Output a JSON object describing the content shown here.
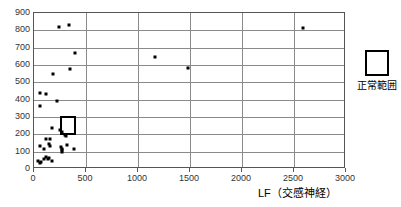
{
  "chart_data": {
    "type": "scatter",
    "title": "",
    "xlabel": "LF（交感神経）",
    "ylabel": "",
    "xlim": [
      0,
      3000
    ],
    "ylim": [
      0,
      900
    ],
    "xticks": [
      0,
      500,
      1000,
      1500,
      2000,
      2500,
      3000
    ],
    "xtick_labels": [
      "0",
      "500",
      "1000",
      "1500",
      "2000",
      "2500",
      "3000"
    ],
    "yticks": [
      0,
      100,
      200,
      300,
      400,
      500,
      600,
      700,
      800,
      900
    ],
    "ytick_labels": [
      "0",
      "100",
      "200",
      "300",
      "400",
      "500",
      "600",
      "700",
      "800",
      "900"
    ],
    "grid": true,
    "grid_axes": "both",
    "marker": "square",
    "marker_color": "#000000",
    "legend_position": "right-outside",
    "series": [
      {
        "name": "data",
        "points": [
          [
            245,
            818
          ],
          [
            335,
            832
          ],
          [
            2590,
            812
          ],
          [
            390,
            667
          ],
          [
            1160,
            645
          ],
          [
            1480,
            585
          ],
          [
            345,
            577
          ],
          [
            185,
            548
          ],
          [
            60,
            440
          ],
          [
            118,
            435
          ],
          [
            222,
            393
          ],
          [
            62,
            362
          ],
          [
            170,
            237
          ],
          [
            248,
            225
          ],
          [
            272,
            213
          ],
          [
            300,
            198
          ],
          [
            305,
            192
          ],
          [
            120,
            175
          ],
          [
            152,
            172
          ],
          [
            60,
            130
          ],
          [
            145,
            145
          ],
          [
            150,
            132
          ],
          [
            262,
            128
          ],
          [
            268,
            115
          ],
          [
            265,
            108
          ],
          [
            268,
            100
          ],
          [
            320,
            140
          ],
          [
            380,
            115
          ],
          [
            100,
            115
          ],
          [
            38,
            48
          ],
          [
            55,
            35
          ],
          [
            70,
            40
          ],
          [
            92,
            60
          ],
          [
            112,
            72
          ],
          [
            130,
            55
          ],
          [
            148,
            62
          ],
          [
            175,
            48
          ]
        ]
      }
    ],
    "annotations": [
      {
        "name": "normal-range-rectangle",
        "type": "rectangle",
        "x0": 248,
        "x1": 400,
        "y0": 198,
        "y1": 305
      }
    ]
  },
  "legend": {
    "label": "正常範囲"
  }
}
